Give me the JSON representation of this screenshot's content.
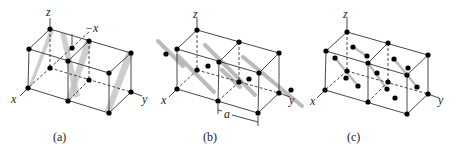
{
  "figure": {
    "panels": [
      {
        "id": "a",
        "caption": "(a)",
        "axis_labels": {
          "z": "z",
          "neg_x": "−x",
          "x": "x",
          "y": "y"
        }
      },
      {
        "id": "b",
        "caption": "(b)",
        "axis_labels": {
          "z": "z",
          "x": "x",
          "y": "y"
        },
        "dimension_label": "a"
      },
      {
        "id": "c",
        "caption": "(c)",
        "axis_labels": {
          "z": "z",
          "x": "x",
          "y": "y"
        }
      }
    ],
    "colors": {
      "atom": "#000000",
      "edge": "#333333",
      "plane_shade": "#bdbdbd",
      "background": "#ffffff"
    }
  }
}
